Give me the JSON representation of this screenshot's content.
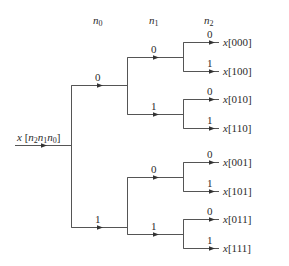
{
  "diagram": {
    "type": "bit-reversal-tree",
    "column_headers": [
      {
        "var": "n",
        "sub": "0"
      },
      {
        "var": "n",
        "sub": "1"
      },
      {
        "var": "n",
        "sub": "2"
      }
    ],
    "input_label": {
      "prefix": "x [",
      "parts": [
        {
          "var": "n",
          "sub": "2"
        },
        {
          "var": "n",
          "sub": "1"
        },
        {
          "var": "n",
          "sub": "0"
        }
      ],
      "suffix": "]"
    },
    "branch_labels": {
      "level0": [
        "0",
        "1"
      ],
      "level1": [
        "0",
        "1",
        "0",
        "1"
      ],
      "level2": [
        "0",
        "1",
        "0",
        "1",
        "0",
        "1",
        "0",
        "1"
      ]
    },
    "outputs": [
      {
        "var": "x",
        "index": "[000]"
      },
      {
        "var": "x",
        "index": "[100]"
      },
      {
        "var": "x",
        "index": "[010]"
      },
      {
        "var": "x",
        "index": "[110]"
      },
      {
        "var": "x",
        "index": "[001]"
      },
      {
        "var": "x",
        "index": "[101]"
      },
      {
        "var": "x",
        "index": "[011]"
      },
      {
        "var": "x",
        "index": "[111]"
      }
    ],
    "line_color": "#555555"
  }
}
